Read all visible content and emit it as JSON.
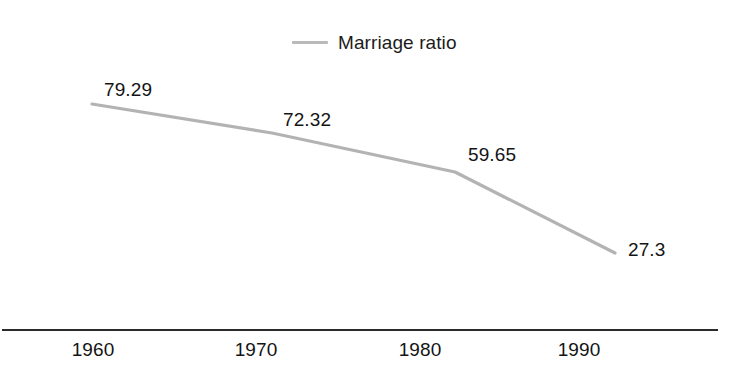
{
  "chart_data": {
    "type": "line",
    "title": "",
    "subtitle": "",
    "xlabel": "",
    "ylabel": "",
    "categories": [
      "1960",
      "1970",
      "1980",
      "1990"
    ],
    "x": [
      1960,
      1970,
      1980,
      1990
    ],
    "series": [
      {
        "name": "Marriage ratio",
        "values": [
          79.29,
          72.32,
          59.65,
          27.3
        ],
        "value_labels": [
          "79.29",
          "72.32",
          "59.65",
          "27.3"
        ],
        "color": "#b3b3b3",
        "line_width": 3,
        "markers": false
      }
    ],
    "xlim": [
      1960,
      1990
    ],
    "ylim": [
      27.3,
      79.29
    ],
    "grid": false,
    "y_axis_visible": false,
    "x_axis_visible": true,
    "legend": {
      "visible": true,
      "position": "top-center",
      "entries": [
        {
          "label": "Marriage ratio",
          "swatch": "line",
          "color": "#b3b3b3"
        }
      ]
    },
    "data_labels": {
      "visible": true,
      "values": [
        "79.29",
        "72.32",
        "59.65",
        "27.3"
      ]
    },
    "background_color": "#ffffff",
    "axis_color": "#2b2b2b",
    "text_color": "#141414"
  },
  "legend": {
    "label": "Marriage ratio"
  },
  "axis": {
    "ticks": [
      "1960",
      "1970",
      "1980",
      "1990"
    ]
  },
  "labels": {
    "p0": "79.29",
    "p1": "72.32",
    "p2": "59.65",
    "p3": "27.3"
  },
  "geometry": {
    "points": [
      {
        "x": 92,
        "y": 104
      },
      {
        "x": 272,
        "y": 133
      },
      {
        "x": 455,
        "y": 172
      },
      {
        "x": 615,
        "y": 253
      }
    ]
  }
}
